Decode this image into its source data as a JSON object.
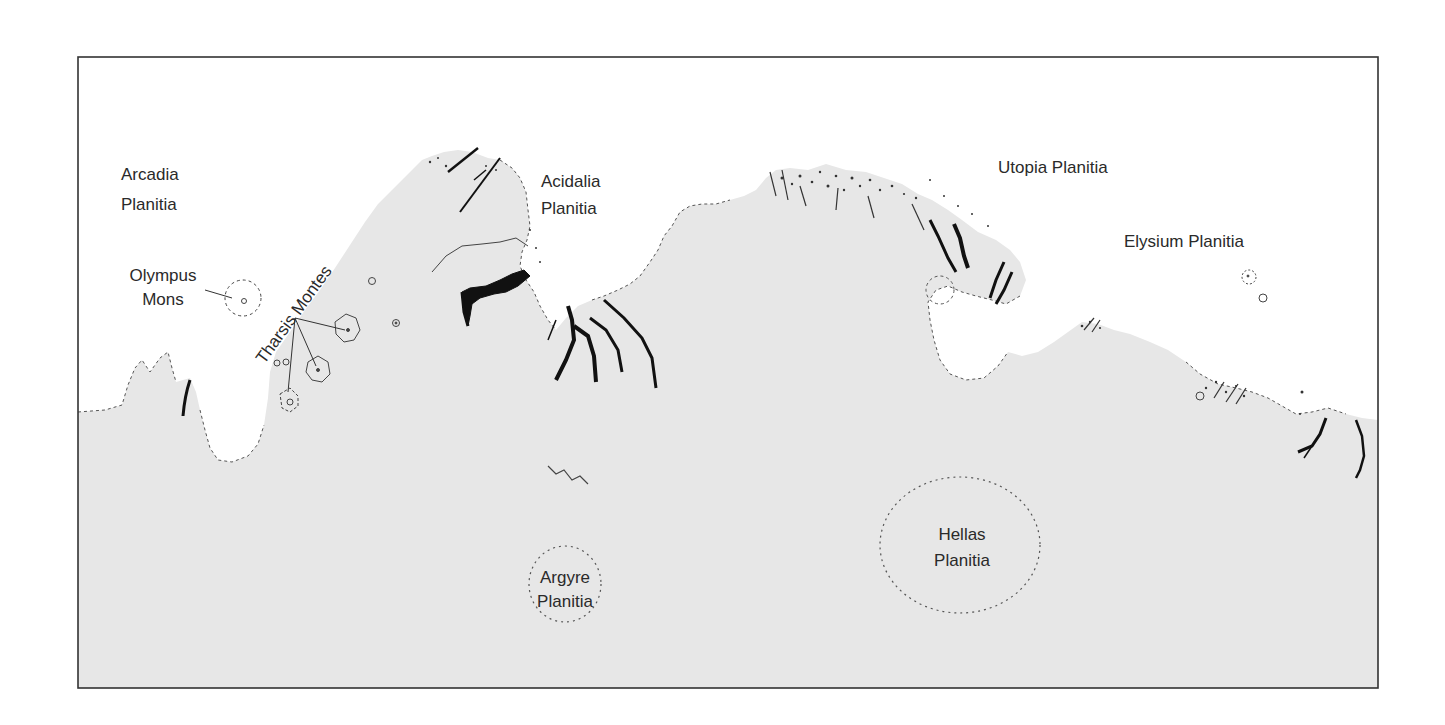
{
  "map": {
    "title": "",
    "colors": {
      "background": "#ffffff",
      "uplands": "#e7e7e7",
      "frame": "#333333",
      "channels": "#111111",
      "text": "#2a2a2a"
    },
    "regions": [
      {
        "id": "arcadia",
        "lines": [
          "Arcadia",
          "Planitia"
        ]
      },
      {
        "id": "olympus",
        "lines": [
          "Olympus",
          "Mons"
        ]
      },
      {
        "id": "tharsis",
        "lines": [
          "Tharsis Montes"
        ]
      },
      {
        "id": "acidalia",
        "lines": [
          "Acidalia",
          "Planitia"
        ]
      },
      {
        "id": "utopia",
        "lines": [
          "Utopia Planitia"
        ]
      },
      {
        "id": "elysium",
        "lines": [
          "Elysium Planitia"
        ]
      },
      {
        "id": "argyre",
        "lines": [
          "Argyre",
          "Planitia"
        ]
      },
      {
        "id": "hellas",
        "lines": [
          "Hellas",
          "Planitia"
        ]
      }
    ]
  }
}
